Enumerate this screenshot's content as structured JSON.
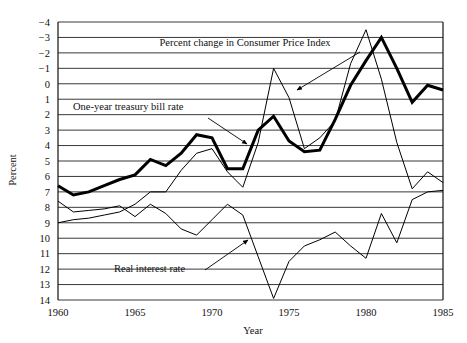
{
  "chart_data": {
    "type": "line",
    "title": "",
    "xlabel": "Year",
    "ylabel": "Percent",
    "xlim": [
      1960,
      1985
    ],
    "ylim": [
      -4,
      14
    ],
    "xticks": [
      1960,
      1965,
      1970,
      1975,
      1980,
      1985
    ],
    "yticks": [
      -4,
      -3,
      -2,
      -1,
      0,
      1,
      2,
      3,
      4,
      5,
      6,
      7,
      8,
      9,
      10,
      11,
      12,
      13,
      14
    ],
    "grid": true,
    "legend_position": "inline-annotations",
    "x": [
      1960,
      1961,
      1962,
      1963,
      1964,
      1965,
      1966,
      1967,
      1968,
      1969,
      1970,
      1971,
      1972,
      1973,
      1974,
      1975,
      1976,
      1977,
      1978,
      1979,
      1980,
      1981,
      1982,
      1983,
      1984,
      1985
    ],
    "series": [
      {
        "name": "One-year treasury bill rate",
        "style": "thick",
        "values": [
          3.4,
          2.8,
          3.0,
          3.4,
          3.8,
          4.1,
          5.1,
          4.7,
          5.5,
          6.7,
          6.5,
          4.5,
          4.5,
          7.0,
          7.9,
          6.3,
          5.6,
          5.7,
          7.7,
          9.9,
          11.5,
          13.0,
          11.0,
          8.8,
          9.9,
          9.6
        ]
      },
      {
        "name": "Percent change in Consumer Price Index",
        "style": "thin",
        "values": [
          1.0,
          1.2,
          1.3,
          1.5,
          1.7,
          2.2,
          3.0,
          3.0,
          4.4,
          5.5,
          5.8,
          4.3,
          3.3,
          6.2,
          11.0,
          9.1,
          5.8,
          6.5,
          7.6,
          11.3,
          13.5,
          10.3,
          6.2,
          3.2,
          4.3,
          3.6
        ]
      },
      {
        "name": "Real interest rate",
        "style": "thin",
        "values": [
          2.4,
          1.7,
          1.8,
          1.9,
          2.1,
          1.4,
          2.2,
          1.6,
          0.6,
          0.2,
          1.2,
          2.2,
          1.5,
          -1.2,
          -3.9,
          -1.5,
          -0.5,
          -0.1,
          0.4,
          -0.5,
          -1.3,
          1.6,
          -0.3,
          2.5,
          3.0,
          3.1
        ]
      }
    ],
    "annotations": [
      {
        "text": "Percent change in Consumer Price Index",
        "x": 245,
        "y": 46
      },
      {
        "text": "One-year treasury bill rate",
        "x": 73,
        "y": 110
      },
      {
        "text": "Real interest rate",
        "x": 114,
        "y": 272
      }
    ]
  },
  "axes": {
    "ylabel": "Percent",
    "xlabel": "Year",
    "ytick_labels": [
      "14",
      "13",
      "12",
      "11",
      "10",
      "9",
      "8",
      "7",
      "6",
      "5",
      "4",
      "3",
      "2",
      "1",
      "0",
      "−1",
      "−2",
      "−3",
      "−4"
    ],
    "xtick_labels": [
      "1960",
      "1965",
      "1970",
      "1975",
      "1980",
      "1985"
    ]
  }
}
